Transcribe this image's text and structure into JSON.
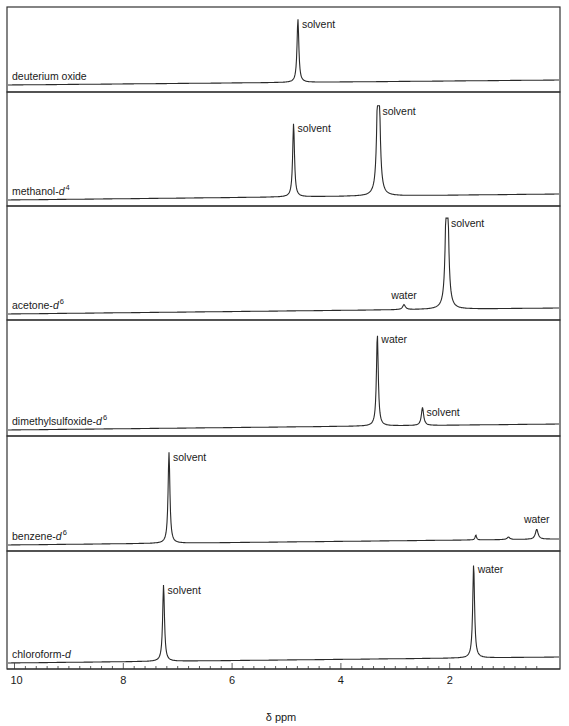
{
  "chart_data": {
    "type": "line",
    "title": "",
    "xlabel": "δ ppm",
    "ylabel": "",
    "xlim": [
      10,
      0.3
    ],
    "x_reversed": true,
    "x_ticks_major": [
      10,
      8,
      6,
      4,
      2
    ],
    "x_tick_labels": [
      "10",
      "8",
      "6",
      "4",
      "2"
    ],
    "x_ticks_minor_step": 0.2,
    "grid": false,
    "legend": null,
    "layout": "stacked panels (6), shared x-axis at bottom",
    "series": [
      {
        "name": "deuterium oxide",
        "name_base": "deuterium oxide",
        "name_italic": "",
        "name_sup": "",
        "peaks": [
          {
            "ppm": 4.79,
            "height": 0.92,
            "width": 0.02,
            "label": "solvent",
            "label_side": "right"
          }
        ]
      },
      {
        "name": "methanol-d4",
        "name_base": "methanol-",
        "name_italic": "d",
        "name_sup": "4",
        "peaks": [
          {
            "ppm": 4.87,
            "height": 0.75,
            "width": 0.02,
            "label": "solvent",
            "label_side": "right"
          },
          {
            "ppm": 3.31,
            "height": 0.92,
            "width": 0.025,
            "multiplet": true,
            "label": "solvent",
            "label_side": "right"
          }
        ]
      },
      {
        "name": "acetone-d6",
        "name_base": "acetone-",
        "name_italic": "d",
        "name_sup": "6",
        "peaks": [
          {
            "ppm": 2.84,
            "height": 0.05,
            "width": 0.03,
            "label": "water",
            "label_side": "above"
          },
          {
            "ppm": 2.05,
            "height": 0.93,
            "width": 0.025,
            "multiplet": true,
            "label": "solvent",
            "label_side": "right"
          }
        ]
      },
      {
        "name": "dimethylsulfoxide-d6",
        "name_base": "dimethylsulfoxide-",
        "name_italic": "d",
        "name_sup": "6",
        "peaks": [
          {
            "ppm": 3.33,
            "height": 0.92,
            "width": 0.02,
            "label": "water",
            "label_side": "right"
          },
          {
            "ppm": 2.5,
            "height": 0.18,
            "width": 0.025,
            "label": "solvent",
            "label_side": "right"
          }
        ]
      },
      {
        "name": "benzene-d6",
        "name_base": "benzene-",
        "name_italic": "d",
        "name_sup": "6",
        "peaks": [
          {
            "ppm": 7.16,
            "height": 0.92,
            "width": 0.02,
            "label": "solvent",
            "label_side": "right"
          },
          {
            "ppm": 1.52,
            "height": 0.05,
            "width": 0.015,
            "label": "",
            "label_side": "none"
          },
          {
            "ppm": 0.92,
            "height": 0.025,
            "width": 0.03,
            "label": "",
            "label_side": "none"
          },
          {
            "ppm": 0.4,
            "height": 0.1,
            "width": 0.03,
            "label": "water",
            "label_side": "above"
          }
        ]
      },
      {
        "name": "chloroform-d",
        "name_base": "chloroform-",
        "name_italic": "d",
        "name_sup": "",
        "peaks": [
          {
            "ppm": 7.26,
            "height": 0.75,
            "width": 0.02,
            "label": "solvent",
            "label_side": "right"
          },
          {
            "ppm": 1.56,
            "height": 0.92,
            "width": 0.02,
            "label": "water",
            "label_side": "right"
          }
        ]
      }
    ]
  },
  "axis": {
    "xlabel": "δ ppm",
    "tick_labels": [
      "10",
      "8",
      "6",
      "4",
      "2"
    ]
  },
  "colors": {
    "line": "#2a2a2a",
    "frame": "#333333",
    "background": "#ffffff"
  }
}
